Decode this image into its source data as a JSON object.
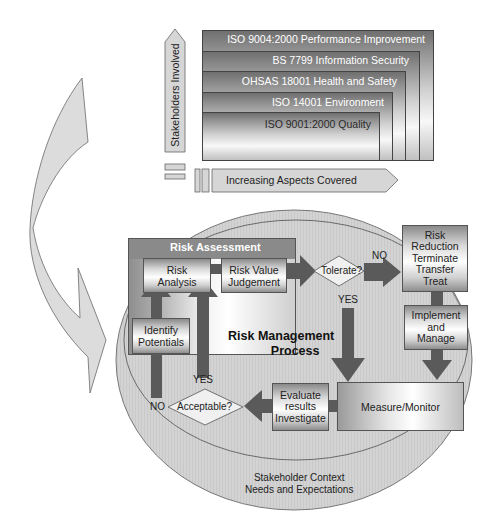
{
  "top": {
    "vertical_arrow_label": "Stakeholders Involved",
    "horizontal_arrow_label": "Increasing Aspects Covered",
    "standards": [
      {
        "label": "ISO 9004:2000 Performance Improvement"
      },
      {
        "label": "BS 7799 Information Security"
      },
      {
        "label": "OHSAS 18001 Health and Safety"
      },
      {
        "label": "ISO 14001 Environment"
      },
      {
        "label": "ISO 9001:2000 Quality"
      }
    ]
  },
  "process": {
    "assessment_title": "Risk Assessment",
    "risk_analysis": [
      "Risk",
      "Analysis"
    ],
    "risk_value": [
      "Risk Value",
      "Judgement"
    ],
    "identify": [
      "Identify",
      "Potentials"
    ],
    "center_title": [
      "Risk Management",
      "Process"
    ],
    "tolerate": "Tolerate?",
    "no_label_top": "NO",
    "yes_label_tolerate": "YES",
    "risk_reduction": [
      "Risk",
      "Reduction",
      "Terminate",
      "Transfer",
      "Treat"
    ],
    "implement": [
      "Implement",
      "and",
      "Manage"
    ],
    "measure": "Measure/Monitor",
    "evaluate": [
      "Evaluate",
      "results",
      "Investigate"
    ],
    "acceptable": "Acceptable?",
    "yes_label_acceptable": "YES",
    "no_label_acceptable": "NO",
    "context": [
      "Stakeholder Context",
      "Needs and Expectations"
    ]
  },
  "colors": {
    "arrow_dark": "#5a5a5a",
    "ellipse_fill": "#d4d4d4",
    "ellipse_stroke": "#777777",
    "curved_arrow_fill": "#dcdcdc",
    "assessment_bg": "#8c8c8c"
  }
}
